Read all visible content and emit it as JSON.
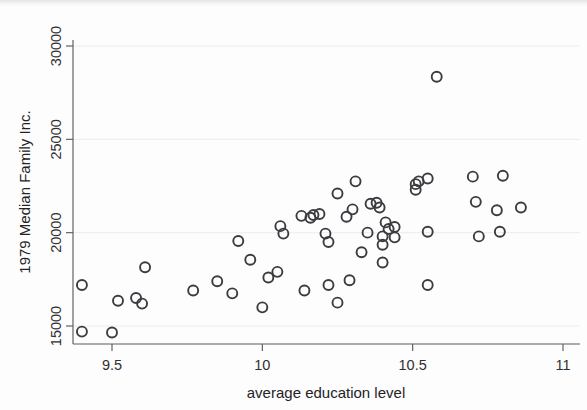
{
  "figure": {
    "background_color": "#ffffff",
    "marker_color": "#3b3b40",
    "axis_color": "#5d5d60",
    "grid_color": "#ececee"
  },
  "chart_data": {
    "type": "scatter",
    "title": "",
    "xlabel": "average education level",
    "ylabel": "1979 Median Family Inc.",
    "xlim": [
      9.4,
      11.0
    ],
    "ylim": [
      14600,
      30500
    ],
    "xticks": [
      9.5,
      10,
      10.5,
      11
    ],
    "xtick_labels": [
      "9.5",
      "10",
      "10.5",
      "11"
    ],
    "yticks": [
      15000,
      20000,
      25000,
      30000
    ],
    "ytick_labels": [
      "15000",
      "20000",
      "25000",
      "30000"
    ],
    "grid": "horizontal",
    "legend": "none",
    "marker_style": "open-circle",
    "n_points": 57,
    "points": [
      {
        "x": 9.4,
        "y": 17200
      },
      {
        "x": 9.4,
        "y": 14700
      },
      {
        "x": 9.5,
        "y": 14650
      },
      {
        "x": 9.52,
        "y": 16350
      },
      {
        "x": 9.58,
        "y": 16500
      },
      {
        "x": 9.6,
        "y": 16200
      },
      {
        "x": 9.61,
        "y": 18150
      },
      {
        "x": 9.77,
        "y": 16900
      },
      {
        "x": 9.85,
        "y": 17400
      },
      {
        "x": 9.9,
        "y": 16750
      },
      {
        "x": 9.92,
        "y": 19550
      },
      {
        "x": 9.96,
        "y": 18550
      },
      {
        "x": 10.0,
        "y": 16000
      },
      {
        "x": 10.02,
        "y": 17600
      },
      {
        "x": 10.05,
        "y": 17900
      },
      {
        "x": 10.06,
        "y": 20350
      },
      {
        "x": 10.07,
        "y": 19950
      },
      {
        "x": 10.14,
        "y": 16900
      },
      {
        "x": 10.16,
        "y": 20800
      },
      {
        "x": 10.17,
        "y": 20950
      },
      {
        "x": 10.21,
        "y": 19950
      },
      {
        "x": 10.22,
        "y": 19500
      },
      {
        "x": 10.22,
        "y": 17200
      },
      {
        "x": 10.25,
        "y": 16250
      },
      {
        "x": 10.25,
        "y": 22100
      },
      {
        "x": 10.28,
        "y": 20850
      },
      {
        "x": 10.29,
        "y": 17450
      },
      {
        "x": 10.3,
        "y": 21250
      },
      {
        "x": 10.31,
        "y": 22750
      },
      {
        "x": 10.33,
        "y": 18950
      },
      {
        "x": 10.35,
        "y": 20000
      },
      {
        "x": 10.38,
        "y": 21600
      },
      {
        "x": 10.39,
        "y": 21350
      },
      {
        "x": 10.4,
        "y": 19800
      },
      {
        "x": 10.4,
        "y": 19350
      },
      {
        "x": 10.4,
        "y": 18400
      },
      {
        "x": 10.41,
        "y": 20550
      },
      {
        "x": 10.42,
        "y": 20200
      },
      {
        "x": 10.44,
        "y": 20300
      },
      {
        "x": 10.51,
        "y": 22600
      },
      {
        "x": 10.51,
        "y": 22300
      },
      {
        "x": 10.52,
        "y": 22750
      },
      {
        "x": 10.55,
        "y": 22900
      },
      {
        "x": 10.55,
        "y": 20050
      },
      {
        "x": 10.55,
        "y": 17200
      },
      {
        "x": 10.58,
        "y": 28350
      },
      {
        "x": 10.7,
        "y": 23000
      },
      {
        "x": 10.71,
        "y": 21650
      },
      {
        "x": 10.72,
        "y": 19800
      },
      {
        "x": 10.78,
        "y": 21200
      },
      {
        "x": 10.79,
        "y": 20050
      },
      {
        "x": 10.8,
        "y": 23050
      },
      {
        "x": 10.86,
        "y": 21350
      },
      {
        "x": 10.36,
        "y": 21550
      },
      {
        "x": 10.44,
        "y": 19750
      },
      {
        "x": 10.19,
        "y": 21000
      },
      {
        "x": 10.13,
        "y": 20900
      }
    ]
  }
}
